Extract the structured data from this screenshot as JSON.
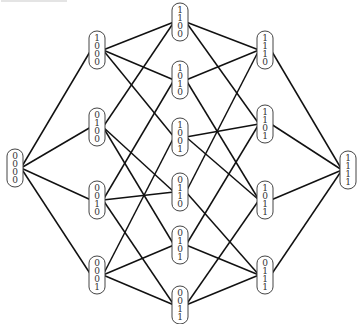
{
  "diagram": {
    "edge_color": "#111111",
    "node_stroke": "#444444",
    "node_size": {
      "w": 16,
      "h": 38
    },
    "nodes": [
      {
        "id": "0000",
        "x": 15,
        "y": 168
      },
      {
        "id": "1000",
        "x": 97,
        "y": 50
      },
      {
        "id": "0100",
        "x": 97,
        "y": 127
      },
      {
        "id": "0010",
        "x": 97,
        "y": 200
      },
      {
        "id": "0001",
        "x": 97,
        "y": 275
      },
      {
        "id": "1100",
        "x": 180,
        "y": 22
      },
      {
        "id": "1010",
        "x": 180,
        "y": 80
      },
      {
        "id": "1001",
        "x": 180,
        "y": 137
      },
      {
        "id": "0110",
        "x": 180,
        "y": 192
      },
      {
        "id": "0101",
        "x": 180,
        "y": 245
      },
      {
        "id": "0011",
        "x": 180,
        "y": 305
      },
      {
        "id": "1110",
        "x": 265,
        "y": 50
      },
      {
        "id": "1101",
        "x": 265,
        "y": 124
      },
      {
        "id": "1011",
        "x": 265,
        "y": 200
      },
      {
        "id": "0111",
        "x": 265,
        "y": 275
      },
      {
        "id": "1111",
        "x": 348,
        "y": 170
      }
    ]
  }
}
